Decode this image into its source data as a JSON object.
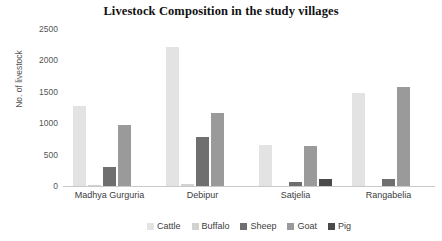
{
  "chart_data": {
    "type": "bar",
    "title": "Livestock Composition in the study villages",
    "xlabel": "",
    "ylabel": "No. of livestock",
    "ylim": [
      0,
      2500
    ],
    "yticks": [
      0,
      500,
      1000,
      1500,
      2000,
      2500
    ],
    "ytick_labels": [
      "0",
      "500",
      "1000",
      "1500",
      "2000",
      "2500"
    ],
    "grid": false,
    "legend_position": "bottom",
    "categories": [
      "Madhya Gurguria",
      "Debipur",
      "Satjelia",
      "Rangabelia"
    ],
    "series": [
      {
        "name": "Cattle",
        "color": "#e3e3e3",
        "values": [
          1270,
          2220,
          660,
          1480
        ]
      },
      {
        "name": "Buffalo",
        "color": "#d2d2d2",
        "values": [
          10,
          30,
          0,
          0
        ]
      },
      {
        "name": "Sheep",
        "color": "#6f6f6f",
        "values": [
          300,
          780,
          65,
          110
        ]
      },
      {
        "name": "Goat",
        "color": "#9a9a9a",
        "values": [
          970,
          1170,
          640,
          1570
        ]
      },
      {
        "name": "Pig",
        "color": "#4a4a4a",
        "values": [
          0,
          0,
          110,
          0
        ]
      }
    ]
  }
}
